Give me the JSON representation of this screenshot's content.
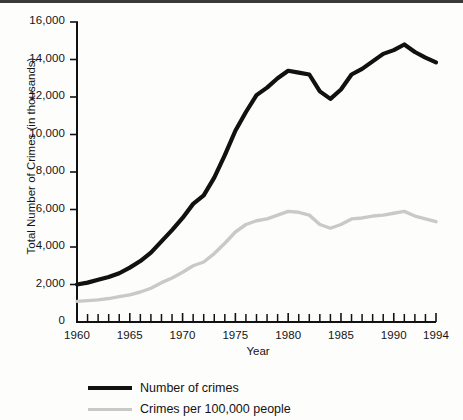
{
  "chart_data": {
    "type": "line",
    "title": "",
    "xlabel": "Year",
    "ylabel": "Total Number of Crimes (in thousands)",
    "xlim": [
      1960,
      1994
    ],
    "ylim": [
      0,
      16000
    ],
    "grid": false,
    "legend_position": "bottom-left",
    "y_ticks": [
      0,
      2000,
      4000,
      6000,
      8000,
      10000,
      12000,
      14000,
      16000
    ],
    "y_tick_labels": [
      "0",
      "2,000",
      "4,000",
      "6,000",
      "8,000",
      "10,000",
      "12,000",
      "14,000",
      "16,000"
    ],
    "x_ticks": [
      1960,
      1965,
      1970,
      1975,
      1980,
      1985,
      1990,
      1994
    ],
    "x_tick_labels": [
      "1960",
      "1965",
      "1970",
      "1975",
      "1980",
      "1985",
      "1990",
      "1994"
    ],
    "x_minor_tick_interval": 1,
    "x": [
      1960,
      1961,
      1962,
      1963,
      1964,
      1965,
      1966,
      1967,
      1968,
      1969,
      1970,
      1971,
      1972,
      1973,
      1974,
      1975,
      1976,
      1977,
      1978,
      1979,
      1980,
      1981,
      1982,
      1983,
      1984,
      1985,
      1986,
      1987,
      1988,
      1989,
      1990,
      1991,
      1992,
      1993,
      1994
    ],
    "series": [
      {
        "name": "Number of crimes",
        "color": "#111111",
        "values": [
          2000,
          2100,
          2250,
          2400,
          2600,
          2900,
          3250,
          3700,
          4300,
          4900,
          5550,
          6300,
          6750,
          7700,
          8900,
          10200,
          11200,
          12100,
          12500,
          13000,
          13400,
          13300,
          13200,
          12300,
          11900,
          12400,
          13200,
          13500,
          13900,
          14300,
          14500,
          14800,
          14400,
          14100,
          13850
        ]
      },
      {
        "name": "Crimes per 100,000 people",
        "color": "#c9c9c9",
        "values": [
          1100,
          1140,
          1180,
          1250,
          1350,
          1450,
          1600,
          1800,
          2100,
          2350,
          2650,
          3000,
          3200,
          3650,
          4200,
          4800,
          5200,
          5400,
          5500,
          5700,
          5900,
          5850,
          5700,
          5200,
          5000,
          5200,
          5500,
          5550,
          5650,
          5700,
          5800,
          5900,
          5650,
          5500,
          5350
        ]
      }
    ]
  },
  "legend": {
    "items": [
      {
        "label": "Number of crimes",
        "style": "swatch-black"
      },
      {
        "label": "Crimes per 100,000 people",
        "style": "swatch-gray"
      }
    ]
  }
}
